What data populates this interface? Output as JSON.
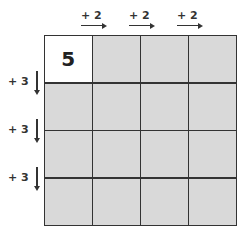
{
  "diagram": {
    "column_labels": [
      "+ 2",
      "+ 2",
      "+ 2"
    ],
    "row_labels": [
      "+ 3",
      "+ 3",
      "+ 3"
    ],
    "grid": {
      "rows": 4,
      "cols": 4,
      "cells": [
        [
          "5",
          "",
          "",
          ""
        ],
        [
          "",
          "",
          "",
          ""
        ],
        [
          "",
          "",
          "",
          ""
        ],
        [
          "",
          "",
          "",
          ""
        ]
      ]
    },
    "colors": {
      "cell_fill": "#d9d9d9",
      "start_cell_fill": "#ffffff",
      "line": "#333333"
    }
  }
}
